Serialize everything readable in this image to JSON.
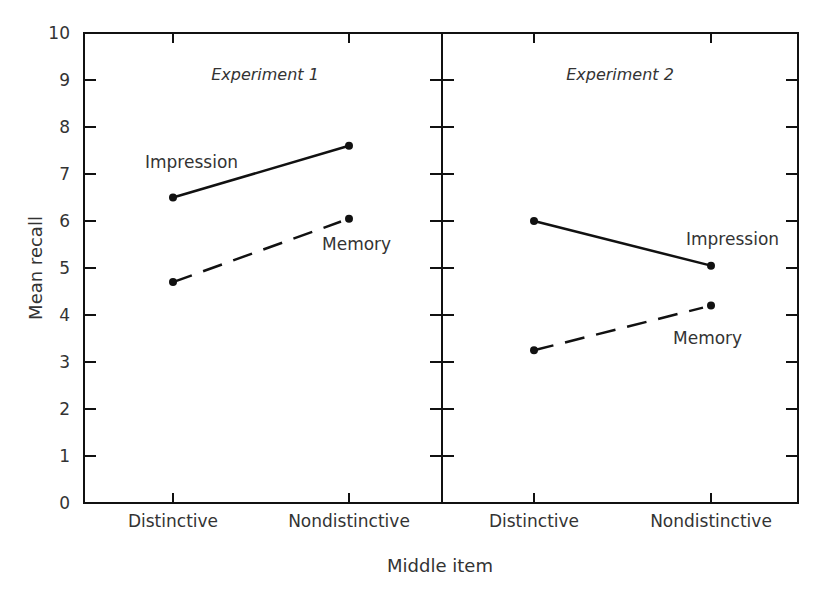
{
  "chart_data": {
    "type": "line",
    "xlabel": "Middle item",
    "ylabel": "Mean recall",
    "ylim": [
      0,
      10
    ],
    "yticks": [
      0,
      1,
      2,
      3,
      4,
      5,
      6,
      7,
      8,
      9,
      10
    ],
    "grid": false,
    "panels": [
      {
        "title": "Experiment 1",
        "categories": [
          "Distinctive",
          "Nondistinctive"
        ],
        "series": [
          {
            "name": "Impression",
            "style": "solid",
            "values": [
              6.5,
              7.6
            ]
          },
          {
            "name": "Memory",
            "style": "dashed",
            "values": [
              4.7,
              6.05
            ]
          }
        ]
      },
      {
        "title": "Experiment 2",
        "categories": [
          "Distinctive",
          "Nondistinctive"
        ],
        "series": [
          {
            "name": "Impression",
            "style": "solid",
            "values": [
              6.0,
              5.05
            ]
          },
          {
            "name": "Memory",
            "style": "dashed",
            "values": [
              3.25,
              4.2
            ]
          }
        ]
      }
    ]
  },
  "labels": {
    "xlabel": "Middle item",
    "ylabel": "Mean recall",
    "panel1_title": "Experiment 1",
    "panel2_title": "Experiment 2",
    "p1_impression": "Impression",
    "p1_memory": "Memory",
    "p2_impression": "Impression",
    "p2_memory": "Memory",
    "cat_distinctive": "Distinctive",
    "cat_nondistinctive": "Nondistinctive"
  },
  "colors": {
    "line": "#111111",
    "text": "#333333"
  }
}
